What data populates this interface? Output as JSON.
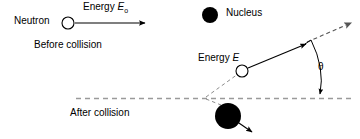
{
  "figure": {
    "background_color": "#ffffff",
    "stroke_color": "#000000",
    "dash_color": "#9a9a9a",
    "width": 360,
    "height": 139
  },
  "labels": {
    "neutron": "Neutron",
    "energy_initial_word": "Energy",
    "energy_initial_symbol": "E",
    "energy_initial_subscript": "o",
    "before_collision": "Before collision",
    "nucleus": "Nucleus",
    "energy_final_word": "Energy",
    "energy_final_symbol": "E",
    "scattering_angle": "θ",
    "after_collision": "After collision"
  },
  "diagram": {
    "before": {
      "neutron_circle": {
        "cx": 68,
        "cy": 23,
        "r": 6,
        "fill": "#ffffff",
        "stroke": "#000000"
      },
      "incoming_arrow": {
        "x1": 75,
        "y1": 23,
        "x2": 146,
        "y2": 23
      }
    },
    "nucleus_legend": {
      "circle": {
        "cx": 210,
        "cy": 15,
        "r": 8,
        "fill": "#000000"
      }
    },
    "after": {
      "baseline_dashed": {
        "x1": 76,
        "y1": 98,
        "x2": 352,
        "y2": 98
      },
      "collision_vertex": {
        "x": 205,
        "y": 98
      },
      "scattered_neutron_circle": {
        "cx": 242,
        "cy": 71,
        "r": 6,
        "fill": "#ffffff",
        "stroke": "#000000"
      },
      "scattered_arrow": {
        "x1": 247,
        "y1": 68,
        "x2": 305,
        "y2": 44
      },
      "dashed_extension_arrow": {
        "x1": 306,
        "y1": 43,
        "x2": 352,
        "y2": 23
      },
      "dashed_guide_to_vertex": {
        "x1": 205,
        "y1": 98,
        "x2": 237,
        "y2": 74
      },
      "recoil_nucleus_circle": {
        "cx": 228,
        "cy": 116,
        "r": 13,
        "fill": "#000000"
      },
      "recoil_arrow": {
        "x1": 236,
        "y1": 120,
        "x2": 254,
        "y2": 132
      },
      "recoil_dashed_guide": {
        "x1": 205,
        "y1": 98,
        "x2": 222,
        "y2": 104
      },
      "angle_arc": {
        "from_x": 311,
        "from_y": 40,
        "to_x": 320,
        "to_y": 96,
        "radius": 58
      }
    }
  }
}
